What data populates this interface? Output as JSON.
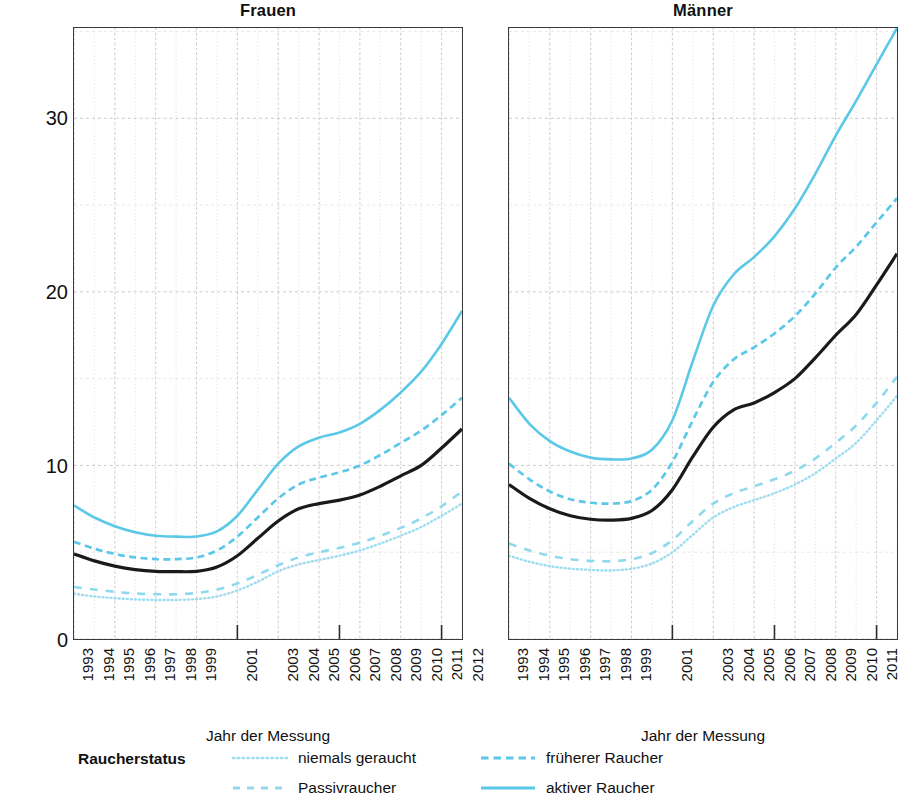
{
  "chart_data": {
    "type": "line",
    "title": "",
    "ylabel": "Prävalenz von Atemwegsobstruktionen",
    "xlabel": "Jahr der Messung",
    "ylim": [
      0,
      35.2
    ],
    "yticks": [
      0,
      10,
      20,
      30
    ],
    "ytick_labels": [
      "0",
      "10",
      "20",
      "30"
    ],
    "grid": true,
    "legend_title": "Raucherstatus",
    "legend_position": "bottom",
    "x": [
      1993,
      1994,
      1995,
      1996,
      1997,
      1998,
      1999,
      2000,
      2001,
      2002,
      2003,
      2004,
      2005,
      2006,
      2007,
      2008,
      2009,
      2010,
      2011,
      2012
    ],
    "xtick_labels": [
      "1993",
      "1994",
      "1995",
      "1996",
      "1997",
      "1998",
      "1999",
      "2001",
      "2003",
      "2004",
      "2005",
      "2006",
      "2007",
      "2008",
      "2009",
      "2010",
      "2011",
      "2012"
    ],
    "xlim": [
      1993,
      2012
    ],
    "panels": [
      {
        "name": "Frauen",
        "series": [
          {
            "name": "niemals geraucht",
            "style": "dotted",
            "color": "#9EDDF0",
            "values": [
              2.6,
              2.45,
              2.35,
              2.28,
              2.25,
              2.25,
              2.3,
              2.45,
              2.8,
              3.3,
              3.9,
              4.3,
              4.55,
              4.8,
              5.1,
              5.5,
              5.95,
              6.45,
              7.1,
              7.8
            ]
          },
          {
            "name": "Passivraucher",
            "style": "dashed-long",
            "color": "#8FD9EF",
            "values": [
              3.0,
              2.85,
              2.72,
              2.62,
              2.58,
              2.58,
              2.65,
              2.85,
              3.2,
              3.7,
              4.25,
              4.7,
              5.0,
              5.25,
              5.55,
              5.95,
              6.4,
              6.95,
              7.65,
              8.5
            ]
          },
          {
            "name": "früherer Raucher",
            "style": "dashed",
            "color": "#5BC8E8",
            "values": [
              5.6,
              5.2,
              4.9,
              4.7,
              4.6,
              4.6,
              4.7,
              5.1,
              5.9,
              7.0,
              8.1,
              8.9,
              9.3,
              9.6,
              10.0,
              10.6,
              11.3,
              12.0,
              12.9,
              13.9
            ]
          },
          {
            "name": "aktiver Raucher",
            "style": "solid",
            "color": "#5BC8E8",
            "values": [
              7.7,
              7.0,
              6.5,
              6.15,
              5.95,
              5.9,
              5.9,
              6.2,
              7.1,
              8.6,
              10.1,
              11.1,
              11.6,
              11.9,
              12.4,
              13.2,
              14.2,
              15.4,
              17.0,
              18.9
            ]
          },
          {
            "name": "gesamt",
            "style": "solid",
            "color": "#1a1a1a",
            "values": [
              4.9,
              4.5,
              4.2,
              4.0,
              3.9,
              3.88,
              3.9,
              4.15,
              4.8,
              5.8,
              6.8,
              7.5,
              7.8,
              8.0,
              8.3,
              8.8,
              9.4,
              10.0,
              11.0,
              12.1
            ]
          }
        ]
      },
      {
        "name": "Männer",
        "series": [
          {
            "name": "niemals geraucht",
            "style": "dotted",
            "color": "#9EDDF0",
            "values": [
              4.8,
              4.45,
              4.2,
              4.05,
              3.98,
              3.95,
              4.05,
              4.35,
              5.0,
              6.0,
              7.0,
              7.6,
              8.0,
              8.4,
              8.9,
              9.55,
              10.4,
              11.3,
              12.6,
              14.0
            ]
          },
          {
            "name": "Passivraucher",
            "style": "dashed-long",
            "color": "#8FD9EF",
            "values": [
              5.5,
              5.1,
              4.8,
              4.6,
              4.5,
              4.48,
              4.6,
              4.95,
              5.7,
              6.8,
              7.8,
              8.4,
              8.8,
              9.2,
              9.7,
              10.4,
              11.3,
              12.3,
              13.6,
              15.1
            ]
          },
          {
            "name": "früherer Raucher",
            "style": "dashed",
            "color": "#5BC8E8",
            "values": [
              10.1,
              9.2,
              8.5,
              8.05,
              7.85,
              7.8,
              7.95,
              8.6,
              10.2,
              12.6,
              14.8,
              16.1,
              16.8,
              17.6,
              18.6,
              19.9,
              21.4,
              22.6,
              24.0,
              25.4
            ]
          },
          {
            "name": "aktiver Raucher",
            "style": "solid",
            "color": "#5BC8E8",
            "values": [
              13.9,
              12.4,
              11.4,
              10.8,
              10.45,
              10.35,
              10.4,
              10.9,
              12.6,
              16.0,
              19.2,
              21.0,
              22.0,
              23.2,
              24.8,
              26.8,
              29.0,
              31.0,
              33.1,
              35.2
            ]
          },
          {
            "name": "gesamt",
            "style": "solid",
            "color": "#1a1a1a",
            "values": [
              8.9,
              8.1,
              7.5,
              7.1,
              6.9,
              6.85,
              6.95,
              7.4,
              8.6,
              10.5,
              12.2,
              13.2,
              13.6,
              14.2,
              15.0,
              16.2,
              17.5,
              18.7,
              20.4,
              22.2
            ]
          }
        ]
      }
    ],
    "legend_entries": [
      {
        "label": "niemals geraucht",
        "style": "dotted",
        "color": "#9EDDF0"
      },
      {
        "label": "Passivraucher",
        "style": "dashed-long",
        "color": "#8FD9EF"
      },
      {
        "label": "früherer Raucher",
        "style": "dashed",
        "color": "#5BC8E8"
      },
      {
        "label": "aktiver Raucher",
        "style": "solid",
        "color": "#5BC8E8"
      }
    ]
  },
  "panels": {
    "left_title": "Frauen",
    "right_title": "Männer"
  },
  "axes": {
    "y_label": "Prävalenz von Atemwegsobstruktionen",
    "x_label": "Jahr der Messung"
  },
  "legend": {
    "title": "Raucherstatus"
  }
}
